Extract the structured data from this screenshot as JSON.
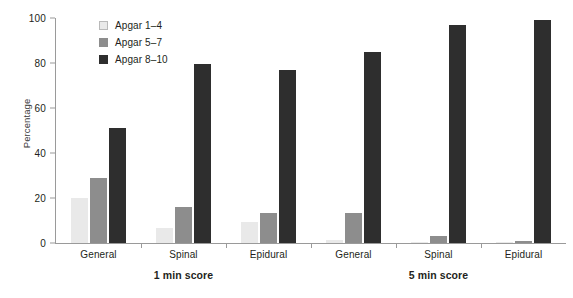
{
  "chart_data": {
    "type": "bar",
    "title": "",
    "xlabel": "",
    "ylabel": "Percentage",
    "ylim": [
      0,
      100
    ],
    "yticks": [
      0,
      20,
      40,
      60,
      80,
      100
    ],
    "grid": false,
    "legend_position": "top-left",
    "categories": [
      "General",
      "Spinal",
      "Epidural",
      "General",
      "Spinal",
      "Epidural"
    ],
    "group_sections": [
      {
        "label": "1 min score",
        "categories": [
          "General",
          "Spinal",
          "Epidural"
        ]
      },
      {
        "label": "5 min score",
        "categories": [
          "General",
          "Spinal",
          "Epidural"
        ]
      }
    ],
    "series": [
      {
        "name": "Apgar 1–4",
        "color": "#e9e9e9",
        "values": [
          20,
          6.5,
          9.5,
          1.5,
          0.5,
          0.3
        ]
      },
      {
        "name": "Apgar 5–7",
        "color": "#8d8d8d",
        "values": [
          29,
          16,
          13.5,
          13.5,
          3,
          1
        ]
      },
      {
        "name": "Apgar 8–10",
        "color": "#2e2e2e",
        "values": [
          51,
          79.5,
          77,
          85,
          97,
          99
        ]
      }
    ]
  }
}
